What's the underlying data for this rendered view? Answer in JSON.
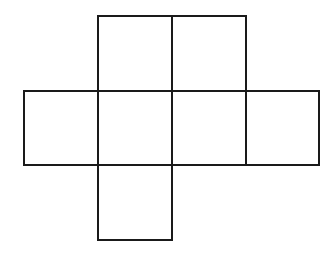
{
  "diagram": {
    "type": "cube-net",
    "stroke_color": "#1a1a1a",
    "background": "#ffffff",
    "grid": {
      "cols_x": [
        24,
        98,
        172,
        246,
        319
      ],
      "rows_y": [
        16,
        91,
        165,
        240
      ]
    },
    "squares": [
      {
        "id": "top-left",
        "row": 0,
        "col": 1
      },
      {
        "id": "top-right",
        "row": 0,
        "col": 2
      },
      {
        "id": "middle-1",
        "row": 1,
        "col": 0
      },
      {
        "id": "middle-2",
        "row": 1,
        "col": 1
      },
      {
        "id": "middle-3",
        "row": 1,
        "col": 2
      },
      {
        "id": "middle-4",
        "row": 1,
        "col": 3
      },
      {
        "id": "bottom",
        "row": 2,
        "col": 1
      }
    ]
  }
}
